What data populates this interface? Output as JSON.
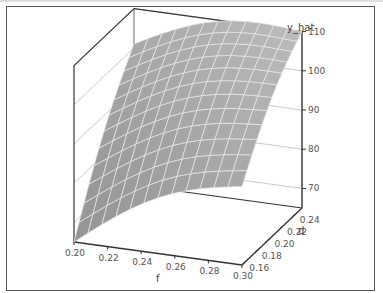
{
  "chart_data": {
    "type": "surface3d",
    "title": "",
    "x": {
      "label": "f",
      "ticks": [
        "0.20",
        "0.22",
        "0.24",
        "0.26",
        "0.28",
        "0.30"
      ],
      "range": [
        0.2,
        0.3
      ]
    },
    "y": {
      "label": "d",
      "ticks": [
        "0.16",
        "0.18",
        "0.20",
        "0.22",
        "0.24"
      ],
      "range": [
        0.155,
        0.25
      ]
    },
    "z": {
      "label": "y_hat",
      "ticks": [
        "70",
        "80",
        "90",
        "100",
        "110"
      ],
      "range": [
        65,
        110
      ]
    },
    "corners": [
      {
        "f": 0.2,
        "d": 0.16,
        "y_hat": 65
      },
      {
        "f": 0.3,
        "d": 0.16,
        "y_hat": 85
      },
      {
        "f": 0.2,
        "d": 0.25,
        "y_hat": 101
      },
      {
        "f": 0.3,
        "d": 0.25,
        "y_hat": 110
      }
    ],
    "grid": true,
    "surface_color": "#a0a0a0",
    "mesh_color": "#e8e8e8"
  },
  "axes": {
    "z_label": "y_hat",
    "x_label": "f",
    "y_label": "d"
  }
}
